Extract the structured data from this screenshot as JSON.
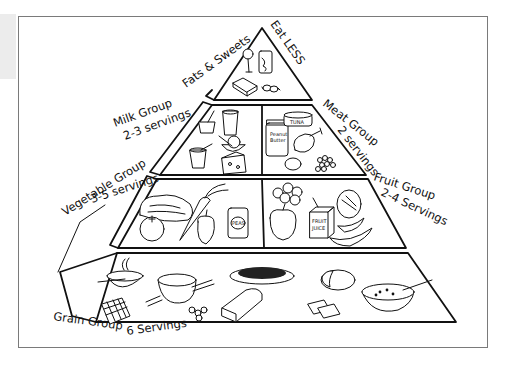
{
  "figure": {
    "style": "black-and-white line drawing",
    "colors": {
      "ink": "#111111",
      "paper": "#ffffff",
      "frame": "#7a7a7a"
    }
  },
  "tiers": [
    {
      "level": 1,
      "groups": [
        {
          "id": "fats",
          "label": "Fats & Sweets",
          "note": "Eat LESS",
          "servings": "",
          "foods": [
            "ice cream bar",
            "soda can",
            "butter stick",
            "wrapped candies"
          ]
        }
      ]
    },
    {
      "level": 2,
      "groups": [
        {
          "id": "milk",
          "label": "Milk Group",
          "servings": "2-3 servings",
          "foods": [
            "yogurt cup",
            "glass of milk",
            "yogurt cup",
            "bowl of cottage cheese",
            "wedge of cheese"
          ]
        },
        {
          "id": "meat",
          "label": "Meat Group",
          "servings": "2 servings",
          "foods": [
            "jar of peanut butter",
            "can of tuna",
            "chicken drumstick",
            "egg",
            "beans"
          ],
          "food_labels": {
            "jar": "Peanut Butter",
            "can": "TUNA"
          }
        }
      ]
    },
    {
      "level": 3,
      "groups": [
        {
          "id": "vegetable",
          "label": "Vegetable Group",
          "servings": "3-5 servings",
          "foods": [
            "lettuce",
            "tomato",
            "carrot",
            "bell pepper",
            "can of peas"
          ],
          "food_labels": {
            "can": "PEAS"
          }
        },
        {
          "id": "fruit",
          "label": "Fruit Group",
          "servings": "2-4 Servings",
          "foods": [
            "strawberries",
            "apple",
            "fruit juice box",
            "melon",
            "bananas"
          ],
          "food_labels": {
            "box": "FRUIT JUICE"
          }
        }
      ]
    },
    {
      "level": 4,
      "groups": [
        {
          "id": "grain",
          "label": "Grain Group",
          "servings": "6 Servings",
          "foods": [
            "bowl of cereal",
            "waffle",
            "bowl of rice with chopsticks",
            "cereal rings",
            "plate of pasta",
            "slice of bread",
            "tortilla / pita",
            "crackers",
            "bowl of soup"
          ]
        }
      ]
    }
  ]
}
